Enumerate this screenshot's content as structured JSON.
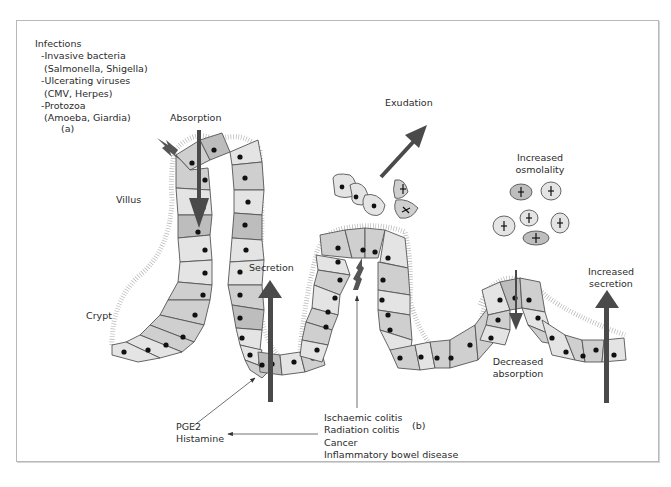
{
  "figure": {
    "panel_a": {
      "tag": "(a)",
      "infections": {
        "title": "Infections",
        "items": [
          {
            "label": "-Invasive bacteria",
            "detail": "(Salmonella, Shigella)"
          },
          {
            "label": "-Ulcerating viruses",
            "detail": "(CMV, Herpes)"
          },
          {
            "label": "-Protozoa",
            "detail": "(Amoeba, Giardia)"
          }
        ]
      },
      "labels": {
        "absorption": "Absorption",
        "villus": "Villus",
        "crypt": "Crypt",
        "secretion": "Secretion",
        "pge2": "PGE2",
        "histamine": "Histamine"
      }
    },
    "panel_b": {
      "tag": "(b)",
      "labels": {
        "exudation": "Exudation",
        "increased_osmolality_1": "Increased",
        "increased_osmolality_2": "osmolality",
        "increased_secretion_1": "Increased",
        "increased_secretion_2": "secretion",
        "decreased_absorption_1": "Decreased",
        "decreased_absorption_2": "absorption"
      },
      "causes": [
        "Ischaemic colitis",
        "Radiation colitis",
        "Cancer",
        "Inflammatory bowel disease"
      ]
    },
    "colors": {
      "arrow": "#4a4a4a",
      "cell_light": "#e4e4e4",
      "cell_mid": "#cfcfcf",
      "cell_dark": "#bdbdbd",
      "outline": "#555555",
      "nucleus": "#111111",
      "frame": "#b8b8b8"
    }
  }
}
